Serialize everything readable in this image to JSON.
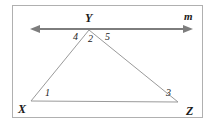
{
  "figure": {
    "type": "geometry-diagram",
    "width": 214,
    "height": 124,
    "background_color": "#ffffff",
    "frame": {
      "stroke_color": "#b0b0b0",
      "stroke_width": 1,
      "x": 12,
      "y": 5,
      "width": 191,
      "height": 113
    },
    "line_m": {
      "label": "m",
      "label_x": 184,
      "label_y": 20,
      "stroke_color": "#7d7d7d",
      "stroke_width": 2.2,
      "y": 29,
      "x_start": 30,
      "x_end": 193,
      "arrow_left": true,
      "arrow_right": true
    },
    "triangle": {
      "stroke_color": "#9a9a9a",
      "stroke_width": 1,
      "vertices": [
        {
          "name": "X",
          "label": "X",
          "x": 31,
          "y": 101,
          "label_x": 18,
          "label_y": 113
        },
        {
          "name": "Y",
          "label": "Y",
          "x": 89,
          "y": 30,
          "label_x": 85,
          "label_y": 22
        },
        {
          "name": "Z",
          "label": "Z",
          "x": 178,
          "y": 102,
          "label_x": 186,
          "label_y": 115
        }
      ],
      "sides": [
        {
          "name": "XY",
          "from": "X",
          "to": "Y"
        },
        {
          "name": "YZ",
          "from": "Y",
          "to": "Z"
        },
        {
          "name": "XZ",
          "from": "X",
          "to": "Z"
        }
      ]
    },
    "angle_labels": [
      {
        "name": "angle-1",
        "label": "1",
        "x": 45,
        "y": 96,
        "at_vertex": "X"
      },
      {
        "name": "angle-2",
        "label": "2",
        "x": 88,
        "y": 42,
        "at_vertex": "Y"
      },
      {
        "name": "angle-3",
        "label": "3",
        "x": 166,
        "y": 96,
        "at_vertex": "Z"
      },
      {
        "name": "angle-4",
        "label": "4",
        "x": 73,
        "y": 40,
        "at_vertex": "Y"
      },
      {
        "name": "angle-5",
        "label": "5",
        "x": 105,
        "y": 40,
        "at_vertex": "Y"
      }
    ]
  }
}
